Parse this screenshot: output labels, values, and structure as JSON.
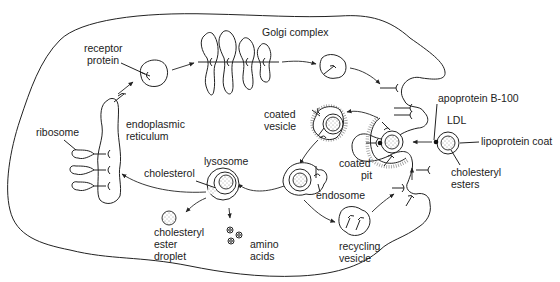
{
  "diagram": {
    "type": "cell-pathway",
    "labels": {
      "golgi": "Golgi complex",
      "receptor_1": "receptor",
      "receptor_2": "protein",
      "ribosome": "ribosome",
      "er_1": "endoplasmic",
      "er_2": "reticulum",
      "coated_vesicle_1": "coated",
      "coated_vesicle_2": "vesicle",
      "apoprotein": "apoprotein B-100",
      "ldl": "LDL",
      "lipoprotein_coat": "lipoprotein coat",
      "lysosome": "lysosome",
      "cholesterol": "cholesterol",
      "coated_pit_1": "coated",
      "coated_pit_2": "pit",
      "cholesteryl_esters_1": "cholesteryl",
      "cholesteryl_esters_2": "esters",
      "endosome": "endosome",
      "ester_droplet_1": "cholesteryl",
      "ester_droplet_2": "ester",
      "ester_droplet_3": "droplet",
      "amino_1": "amino",
      "amino_2": "acids",
      "recycling_1": "recycling",
      "recycling_2": "vesicle"
    },
    "nodes": [
      "ribosome",
      "endoplasmic reticulum",
      "receptor protein",
      "Golgi complex",
      "plasma membrane",
      "LDL",
      "coated pit",
      "coated vesicle",
      "endosome",
      "recycling vesicle",
      "lysosome",
      "cholesteryl ester droplet",
      "amino acids"
    ],
    "edges": [
      [
        "endoplasmic reticulum",
        "receptor protein"
      ],
      [
        "receptor protein",
        "Golgi complex"
      ],
      [
        "Golgi complex",
        "secretory vesicle"
      ],
      [
        "secretory vesicle",
        "plasma membrane"
      ],
      [
        "LDL",
        "coated pit"
      ],
      [
        "coated pit",
        "coated vesicle"
      ],
      [
        "coated vesicle",
        "endosome"
      ],
      [
        "endosome",
        "lysosome"
      ],
      [
        "endosome",
        "recycling vesicle"
      ],
      [
        "recycling vesicle",
        "plasma membrane"
      ],
      [
        "lysosome",
        "endoplasmic reticulum"
      ],
      [
        "lysosome",
        "cholesteryl ester droplet"
      ],
      [
        "lysosome",
        "amino acids"
      ]
    ]
  }
}
